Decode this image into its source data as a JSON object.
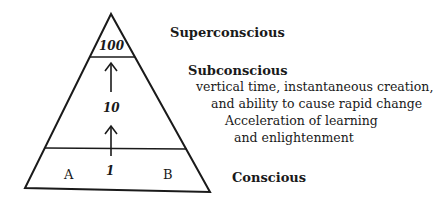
{
  "diagram": {
    "levels": [
      {
        "name": "Superconscious",
        "value": "100"
      },
      {
        "name": "Subconscious",
        "value": "10"
      },
      {
        "name": "Conscious",
        "value": "1"
      }
    ],
    "base_labels": {
      "left": "A",
      "right": "B"
    },
    "subconscious_description": [
      "vertical time, instantaneous creation,",
      "and ability to cause rapid change",
      "Acceleration of learning",
      "and enlightenment"
    ]
  }
}
